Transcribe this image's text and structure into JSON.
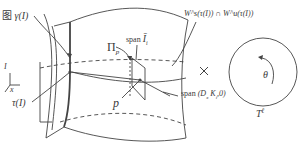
{
  "diagram": {
    "type": "geometric-figure",
    "labels": {
      "gamma_label_prefix": "图",
      "gamma_label": "γ(I)",
      "I_axis": "I",
      "x_axis": "x",
      "tau_label": "τ(I)",
      "Pi_label": "Π",
      "Pi_sub": "p",
      "span_I_label": "span",
      "span_I_sym": "Ī",
      "span_I_sub": "i",
      "intersection_label": "W",
      "intersection_full": "W^s(τ(I)) ∩ W^u(τ(I))",
      "p_label": "p",
      "span_D_label": "span",
      "span_D_args": "(D",
      "span_D_rest": "K",
      "span_D_end": ",0)",
      "times_symbol": "×",
      "theta_label": "θ",
      "torus_label": "T",
      "torus_exp": "ℓ"
    },
    "colors": {
      "stroke": "#444444",
      "text": "#3a3a3a",
      "background": "#ffffff"
    }
  }
}
